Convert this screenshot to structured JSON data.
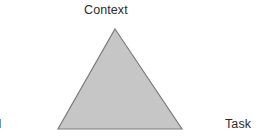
{
  "diagram": {
    "name": "context-tool-task-triangle",
    "type": "triangle-diagram",
    "background_color": "#ffffff",
    "shape": {
      "name": "triangle",
      "fill_color": "#c6c6c6",
      "stroke_color": "#7d7d7d",
      "stroke_width": 1.2,
      "vertices": {
        "apex": [
          115,
          29
        ],
        "bottom_left": [
          58,
          129
        ],
        "bottom_right": [
          182,
          129
        ]
      }
    },
    "labels": {
      "top": {
        "text": "Context",
        "position": "apex",
        "clipped": false
      },
      "bottom_right": {
        "text": "Task",
        "position": "bottom-right",
        "clipped": false
      },
      "bottom_left": {
        "text": "Tool",
        "position": "bottom-left",
        "clipped": true,
        "visible_fragment": "r"
      }
    },
    "text_color": "#2b2b2b"
  }
}
